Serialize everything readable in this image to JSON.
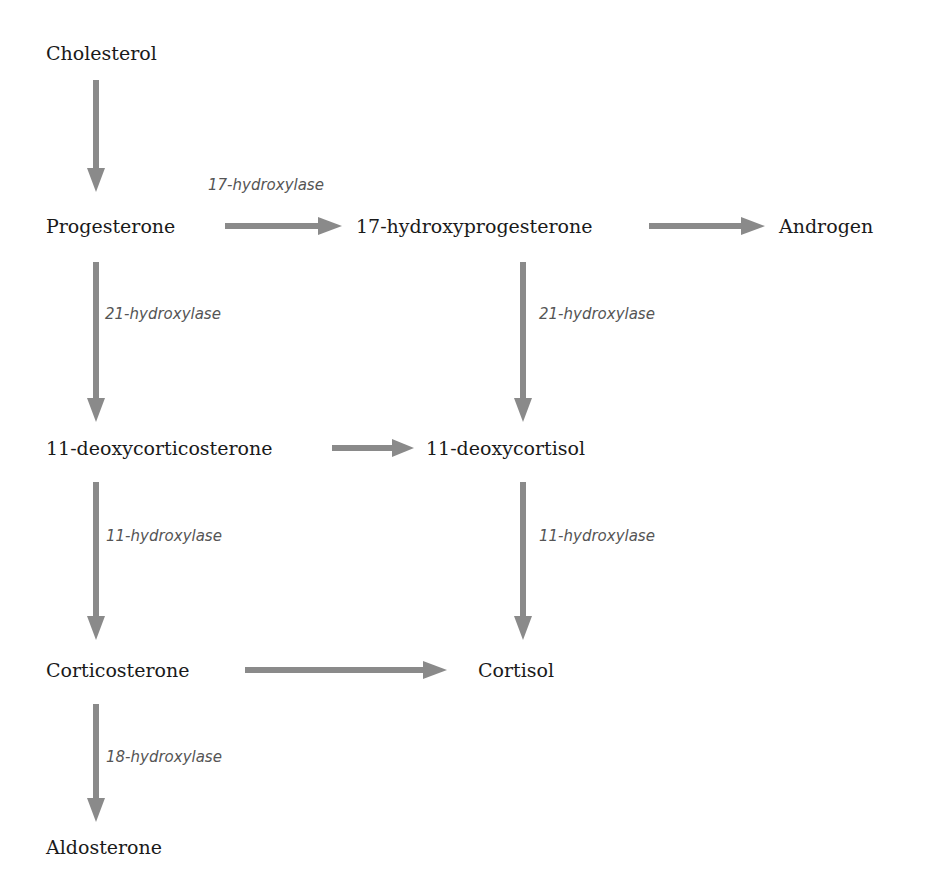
{
  "diagram": {
    "type": "steroidogenesis-pathway",
    "arrow_color": "#8a8a8a",
    "nodes": {
      "cholesterol": "Cholesterol",
      "progesterone": "Progesterone",
      "hydroxyprogesterone": "17-hydroxyprogesterone",
      "androgen": "Androgen",
      "deoxycorticosterone": "11-deoxycorticosterone",
      "deoxycortisol": "11-deoxycortisol",
      "corticosterone": "Corticosterone",
      "cortisol": "Cortisol",
      "aldosterone": "Aldosterone"
    },
    "enzymes": {
      "e17_hydroxylase": "17-hydroxylase",
      "e21_hydroxylase_left": "21-hydroxylase",
      "e21_hydroxylase_right": "21-hydroxylase",
      "e11_hydroxylase_left": "11-hydroxylase",
      "e11_hydroxylase_right": "11-hydroxylase",
      "e18_hydroxylase": "18-hydroxylase"
    },
    "edges": [
      {
        "from": "Cholesterol",
        "to": "Progesterone",
        "label": ""
      },
      {
        "from": "Progesterone",
        "to": "17-hydroxyprogesterone",
        "label": "17-hydroxylase"
      },
      {
        "from": "17-hydroxyprogesterone",
        "to": "Androgen",
        "label": ""
      },
      {
        "from": "Progesterone",
        "to": "11-deoxycorticosterone",
        "label": "21-hydroxylase"
      },
      {
        "from": "17-hydroxyprogesterone",
        "to": "11-deoxycortisol",
        "label": "21-hydroxylase"
      },
      {
        "from": "11-deoxycorticosterone",
        "to": "11-deoxycortisol",
        "label": ""
      },
      {
        "from": "11-deoxycorticosterone",
        "to": "Corticosterone",
        "label": "11-hydroxylase"
      },
      {
        "from": "11-deoxycortisol",
        "to": "Cortisol",
        "label": "11-hydroxylase"
      },
      {
        "from": "Corticosterone",
        "to": "Cortisol",
        "label": ""
      },
      {
        "from": "Corticosterone",
        "to": "Aldosterone",
        "label": "18-hydroxylase"
      }
    ]
  }
}
